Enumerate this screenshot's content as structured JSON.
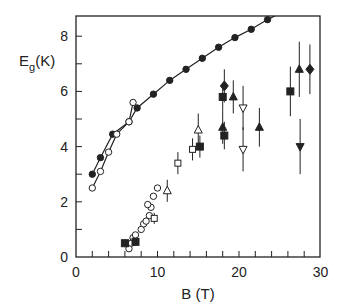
{
  "chart_data": {
    "type": "scatter",
    "title": "",
    "xlabel": "B (T)",
    "ylabel": "E",
    "ylabel_sub": "g",
    "ylabel_unit": "(K)",
    "xlim": [
      0,
      30
    ],
    "ylim": [
      0,
      8.7
    ],
    "x_ticks_labeled": [
      0,
      10,
      20,
      30
    ],
    "y_ticks_labeled": [
      0,
      2,
      4,
      6,
      8
    ],
    "x_minor_step": 2,
    "y_minor_step": 1,
    "grid": false,
    "legend": null,
    "series": [
      {
        "name": "filled-circles-curve",
        "marker": "filled-circle",
        "line": true,
        "points": [
          [
            2,
            3.0
          ],
          [
            3,
            3.6
          ],
          [
            4.5,
            4.45
          ],
          [
            6.5,
            4.9
          ],
          [
            7.5,
            5.4
          ],
          [
            9.5,
            5.9
          ],
          [
            11.5,
            6.4
          ],
          [
            13.5,
            6.8
          ],
          [
            15.5,
            7.2
          ],
          [
            17.5,
            7.6
          ],
          [
            19.5,
            7.95
          ],
          [
            21.5,
            8.25
          ],
          [
            23.5,
            8.6
          ],
          [
            25.5,
            8.9
          ]
        ]
      },
      {
        "name": "open-circles-curve",
        "marker": "open-circle",
        "line": true,
        "points": [
          [
            2,
            2.5
          ],
          [
            3,
            3.1
          ],
          [
            4,
            3.8
          ],
          [
            5,
            4.45
          ],
          [
            6.5,
            4.9
          ],
          [
            7,
            5.6
          ]
        ]
      },
      {
        "name": "open-circles-low",
        "marker": "open-circle",
        "line": false,
        "points": [
          [
            6.5,
            0.3
          ],
          [
            6.8,
            0.5
          ],
          [
            7,
            0.7
          ],
          [
            7.3,
            0.8
          ],
          [
            8,
            1.0
          ],
          [
            8.3,
            1.2
          ],
          [
            8.6,
            1.3
          ],
          [
            9,
            1.5
          ],
          [
            9.2,
            1.8
          ],
          [
            8.8,
            1.9
          ],
          [
            9.5,
            2.2
          ],
          [
            10,
            2.5
          ]
        ]
      },
      {
        "name": "filled-squares",
        "marker": "filled-square",
        "points": [
          [
            6,
            0.5,
            0.15
          ],
          [
            7.3,
            0.55,
            0.15
          ],
          [
            15.2,
            4.0,
            0.4
          ],
          [
            18,
            5.8,
            0.5
          ],
          [
            18.2,
            4.4,
            0.5
          ],
          [
            26.3,
            6.0,
            0.9
          ]
        ]
      },
      {
        "name": "open-squares",
        "marker": "open-square",
        "points": [
          [
            12.5,
            3.4,
            0.4
          ],
          [
            14.3,
            3.9,
            0.4
          ],
          [
            9.6,
            1.4,
            0.2
          ]
        ]
      },
      {
        "name": "open-triangles-up",
        "marker": "open-triangle-up",
        "points": [
          [
            11.2,
            2.4,
            0.4
          ],
          [
            15,
            4.6,
            0.6
          ]
        ]
      },
      {
        "name": "filled-triangles-up",
        "marker": "filled-triangle-up",
        "points": [
          [
            18,
            4.7,
            0.6
          ],
          [
            19.3,
            5.8,
            0.6
          ],
          [
            22.5,
            4.7,
            0.7
          ],
          [
            27.4,
            6.8,
            1.0
          ]
        ]
      },
      {
        "name": "open-triangles-down",
        "marker": "open-triangle-down",
        "points": [
          [
            20.5,
            5.4,
            0.8
          ],
          [
            20.5,
            3.9,
            0.8
          ]
        ]
      },
      {
        "name": "filled-triangles-down",
        "marker": "filled-triangle-down",
        "points": [
          [
            27.5,
            4.0,
            1.0
          ]
        ]
      },
      {
        "name": "filled-diamonds",
        "marker": "filled-diamond",
        "points": [
          [
            18.2,
            6.2,
            0.6
          ],
          [
            28.7,
            6.8,
            0.9
          ]
        ]
      }
    ]
  },
  "axes": {
    "x_label": "B (T)",
    "y_label_main": "E",
    "y_label_sub": "g",
    "y_label_unit": "(K)",
    "x_tick_labels": [
      "0",
      "10",
      "20",
      "30"
    ],
    "y_tick_labels": [
      "0",
      "2",
      "4",
      "6",
      "8"
    ]
  }
}
